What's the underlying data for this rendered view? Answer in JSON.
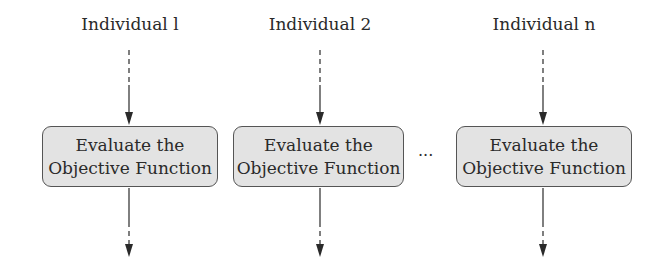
{
  "diagram": {
    "columns": [
      {
        "individual": "Individual l",
        "box_line1": "Evaluate the",
        "box_line2": "Objective Function"
      },
      {
        "individual": "Individual 2",
        "box_line1": "Evaluate the",
        "box_line2": "Objective Function"
      },
      {
        "individual": "Individual n",
        "box_line1": "Evaluate the",
        "box_line2": "Objective Function"
      }
    ],
    "ellipsis": "...",
    "colors": {
      "box_fill": "#e3e3e3",
      "box_border": "#555555",
      "line": "#2a2a2a"
    }
  }
}
